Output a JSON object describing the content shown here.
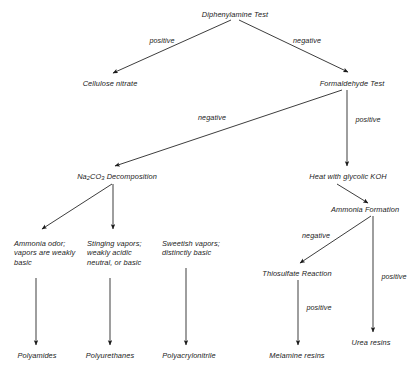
{
  "diagram": {
    "background_color": "#ffffff",
    "line_color": "#1a1a1a",
    "text_color": "#1a1a1a",
    "nodes": [
      {
        "id": "diphenylamine",
        "label": "Diphenylamine Test",
        "x": 235,
        "y": 14
      },
      {
        "id": "cellulose-nitrate",
        "label": "Cellulose nitrate",
        "x": 110,
        "y": 83
      },
      {
        "id": "formaldehyde",
        "label": "Formaldehyde Test",
        "x": 352,
        "y": 83
      },
      {
        "id": "na2co3-decomposition",
        "label": "Na2CO3 Decomposition",
        "x": 117,
        "y": 176
      },
      {
        "id": "heat-glycolic-koh",
        "label": "Heat with glycolic KOH",
        "x": 348,
        "y": 176
      },
      {
        "id": "ammonia-formation",
        "label": "Ammonia Formation",
        "x": 365,
        "y": 209
      },
      {
        "id": "ammonia-odor",
        "label": "Ammonia odor;\nvapors are weakly\nbasic",
        "x": 14,
        "y": 243
      },
      {
        "id": "stinging-vapors",
        "label": "Stinging vapors;\nweakly acidic\nneutral, or basic",
        "x": 87,
        "y": 243
      },
      {
        "id": "sweetish-vapors",
        "label": "Sweetish vapors;\ndistinctly basic",
        "x": 162,
        "y": 243
      },
      {
        "id": "thiosulfate-reaction",
        "label": "Thiosulfate Reaction",
        "x": 297,
        "y": 273
      },
      {
        "id": "urea-resins",
        "label": "Urea resins",
        "x": 371,
        "y": 342
      },
      {
        "id": "polyamides",
        "label": "Polyamides",
        "x": 37,
        "y": 355
      },
      {
        "id": "polyurethanes",
        "label": "Polyurethanes",
        "x": 110,
        "y": 355
      },
      {
        "id": "polyacrylonitrile",
        "label": "Polyacrylonitrile",
        "x": 189,
        "y": 355
      },
      {
        "id": "melamine-resins",
        "label": "Melamine resins",
        "x": 297,
        "y": 355
      }
    ],
    "na2co3_label": {
      "pre": "Na",
      "sub1": "2",
      "mid": "CO",
      "sub2": "3",
      "post": " Decomposition"
    },
    "edges": [
      {
        "id": "diphenylamine-positive",
        "label": "positive",
        "from": "diphenylamine",
        "to": "cellulose-nitrate",
        "x1": 231,
        "y1": 20,
        "x2": 113,
        "y2": 73,
        "label_x": 162,
        "label_y": 36
      },
      {
        "id": "diphenylamine-negative",
        "label": "negative",
        "from": "diphenylamine",
        "to": "formaldehyde",
        "x1": 239,
        "y1": 20,
        "x2": 348,
        "y2": 72,
        "label_x": 307,
        "label_y": 36
      },
      {
        "id": "formaldehyde-negative",
        "label": "negative",
        "from": "formaldehyde",
        "to": "na2co3-decomposition",
        "x1": 342,
        "y1": 90,
        "x2": 115,
        "y2": 166,
        "label_x": 212,
        "label_y": 113
      },
      {
        "id": "formaldehyde-positive",
        "label": "positive",
        "from": "formaldehyde",
        "to": "heat-glycolic-koh",
        "x1": 347,
        "y1": 90,
        "x2": 347,
        "y2": 166,
        "label_x": 368,
        "label_y": 115
      },
      {
        "id": "koh-to-ammonia",
        "label": "",
        "from": "heat-glycolic-koh",
        "to": "ammonia-formation",
        "x1": 337,
        "y1": 184,
        "x2": 368,
        "y2": 203,
        "label_x": 0,
        "label_y": 0
      },
      {
        "id": "ammonia-negative",
        "label": "negative",
        "from": "ammonia-formation",
        "to": "thiosulfate-reaction",
        "x1": 371,
        "y1": 216,
        "x2": 300,
        "y2": 263,
        "label_x": 316,
        "label_y": 231
      },
      {
        "id": "ammonia-positive",
        "label": "positive",
        "from": "ammonia-formation",
        "to": "urea-resins",
        "x1": 373,
        "y1": 216,
        "x2": 373,
        "y2": 332,
        "label_x": 394,
        "label_y": 272
      },
      {
        "id": "thiosulfate-positive",
        "label": "positive",
        "from": "thiosulfate-reaction",
        "to": "melamine-resins",
        "x1": 298,
        "y1": 280,
        "x2": 298,
        "y2": 345,
        "label_x": 319,
        "label_y": 303
      },
      {
        "id": "na2co3-to-ammonia-odor",
        "label": "",
        "from": "na2co3-decomposition",
        "to": "ammonia-odor",
        "x1": 112,
        "y1": 184,
        "x2": 42,
        "y2": 229,
        "label_x": 0,
        "label_y": 0
      },
      {
        "id": "na2co3-to-stinging",
        "label": "",
        "from": "na2co3-decomposition",
        "to": "stinging-vapors",
        "x1": 113,
        "y1": 184,
        "x2": 113,
        "y2": 229,
        "label_x": 0,
        "label_y": 0
      },
      {
        "id": "ammonia-odor-to-polyamides",
        "label": "",
        "from": "ammonia-odor",
        "to": "polyamides",
        "x1": 36,
        "y1": 278,
        "x2": 36,
        "y2": 345,
        "label_x": 0,
        "label_y": 0
      },
      {
        "id": "stinging-to-polyurethanes",
        "label": "",
        "from": "stinging-vapors",
        "to": "polyurethanes",
        "x1": 110,
        "y1": 278,
        "x2": 110,
        "y2": 345,
        "label_x": 0,
        "label_y": 0
      },
      {
        "id": "sweetish-to-polyacrylonitrile",
        "label": "",
        "from": "sweetish-vapors",
        "to": "polyacrylonitrile",
        "x1": 186,
        "y1": 268,
        "x2": 186,
        "y2": 345,
        "label_x": 0,
        "label_y": 0
      }
    ]
  }
}
